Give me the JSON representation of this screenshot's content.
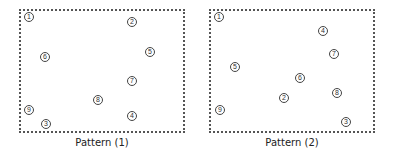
{
  "patterns": [
    {
      "label": "Pattern (1)",
      "markers": [
        {
          "n": "1",
          "x": 29,
          "y": 17
        },
        {
          "n": "2",
          "x": 132,
          "y": 22
        },
        {
          "n": "6",
          "x": 45,
          "y": 57
        },
        {
          "n": "5",
          "x": 150,
          "y": 52
        },
        {
          "n": "7",
          "x": 132,
          "y": 81
        },
        {
          "n": "8",
          "x": 98,
          "y": 100
        },
        {
          "n": "9",
          "x": 29,
          "y": 110
        },
        {
          "n": "4",
          "x": 132,
          "y": 116
        },
        {
          "n": "3",
          "x": 46,
          "y": 124
        }
      ]
    },
    {
      "label": "Pattern (2)",
      "markers": [
        {
          "n": "1",
          "x": 219,
          "y": 17
        },
        {
          "n": "4",
          "x": 323,
          "y": 31
        },
        {
          "n": "7",
          "x": 334,
          "y": 54
        },
        {
          "n": "5",
          "x": 235,
          "y": 67
        },
        {
          "n": "6",
          "x": 300,
          "y": 78
        },
        {
          "n": "8",
          "x": 337,
          "y": 93
        },
        {
          "n": "2",
          "x": 284,
          "y": 98
        },
        {
          "n": "9",
          "x": 220,
          "y": 110
        },
        {
          "n": "3",
          "x": 346,
          "y": 122
        }
      ]
    }
  ]
}
